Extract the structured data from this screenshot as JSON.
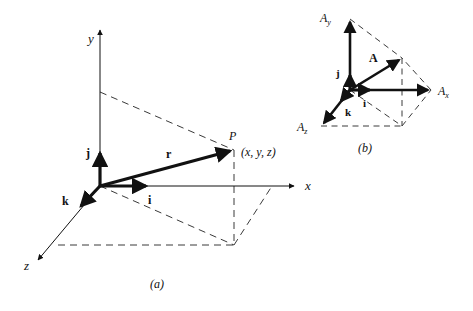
{
  "figure": {
    "title_implicit": "Position vector and unit vectors in Cartesian coordinates",
    "background_color": "#ffffff",
    "stroke_color": "#111111",
    "dash_color": "#3a3a3a",
    "width": 473,
    "height": 311
  },
  "panel_a": {
    "caption": "(a)",
    "caption_pos": {
      "x": 155,
      "y": 285
    },
    "origin": {
      "x": 100,
      "y": 186
    },
    "axes": [
      {
        "name": "y-axis",
        "label": "y",
        "label_pos": {
          "x": 88,
          "y": 43
        },
        "from": {
          "x": 100,
          "y": 186
        },
        "to": {
          "x": 100,
          "y": 28
        }
      },
      {
        "name": "x-axis",
        "label": "x",
        "label_pos": {
          "x": 305,
          "y": 190
        },
        "from": {
          "x": 100,
          "y": 186
        },
        "to": {
          "x": 296,
          "y": 186
        }
      },
      {
        "name": "z-axis",
        "label": "z",
        "label_pos": {
          "x": 24,
          "y": 270
        },
        "from": {
          "x": 100,
          "y": 186
        },
        "to": {
          "x": 36,
          "y": 262
        }
      }
    ],
    "vectors": [
      {
        "name": "unit-vector-i",
        "label": "i",
        "label_pos": {
          "x": 148,
          "y": 203
        },
        "from": {
          "x": 100,
          "y": 186
        },
        "to": {
          "x": 150,
          "y": 186
        }
      },
      {
        "name": "unit-vector-j",
        "label": "j",
        "label_pos": {
          "x": 86,
          "y": 156
        },
        "from": {
          "x": 100,
          "y": 186
        },
        "to": {
          "x": 100,
          "y": 149
        }
      },
      {
        "name": "unit-vector-k",
        "label": "k",
        "label_pos": {
          "x": 63,
          "y": 204
        },
        "from": {
          "x": 100,
          "y": 186
        },
        "to": {
          "x": 79,
          "y": 209
        }
      },
      {
        "name": "position-vector-r",
        "label": "r",
        "label_pos": {
          "x": 167,
          "y": 157
        },
        "from": {
          "x": 100,
          "y": 186
        },
        "to": {
          "x": 234,
          "y": 150
        }
      }
    ],
    "point": {
      "name": "point-P",
      "label": "P",
      "label_pos": {
        "x": 230,
        "y": 139
      },
      "coords_label": "(x, y, z)",
      "coords_pos": {
        "x": 243,
        "y": 155
      },
      "pos": {
        "x": 234,
        "y": 150
      }
    },
    "dashed_lines": [
      {
        "name": "dash-y-to-P",
        "from": {
          "x": 100,
          "y": 92
        },
        "to": {
          "x": 234,
          "y": 150
        }
      },
      {
        "name": "dash-P-down",
        "from": {
          "x": 234,
          "y": 150
        },
        "to": {
          "x": 234,
          "y": 245
        }
      },
      {
        "name": "dash-base-horizontal",
        "from": {
          "x": 58,
          "y": 245
        },
        "to": {
          "x": 234,
          "y": 245
        }
      },
      {
        "name": "dash-origin-to-base-corner",
        "from": {
          "x": 100,
          "y": 186
        },
        "to": {
          "x": 234,
          "y": 245
        }
      },
      {
        "name": "dash-base-corner-to-x",
        "from": {
          "x": 234,
          "y": 245
        },
        "to": {
          "x": 272,
          "y": 186
        }
      }
    ]
  },
  "panel_b": {
    "caption": "(b)",
    "caption_pos": {
      "x": 363,
      "y": 149
    },
    "origin": {
      "x": 350,
      "y": 90
    },
    "components": [
      {
        "name": "component-Ay",
        "label": "A",
        "subscript": "y",
        "label_pos": {
          "x": 322,
          "y": 22
        },
        "from": {
          "x": 350,
          "y": 90
        },
        "to": {
          "x": 350,
          "y": 19
        }
      },
      {
        "name": "component-Ax",
        "label": "A",
        "subscript": "x",
        "label_pos": {
          "x": 438,
          "y": 95
        },
        "from": {
          "x": 350,
          "y": 90
        },
        "to": {
          "x": 431,
          "y": 90
        }
      },
      {
        "name": "component-Az",
        "label": "A",
        "subscript": "z",
        "label_pos": {
          "x": 299,
          "y": 131
        },
        "from": {
          "x": 350,
          "y": 90
        },
        "to": {
          "x": 321,
          "y": 126
        }
      }
    ],
    "vectors": [
      {
        "name": "vector-A",
        "label": "A",
        "label_pos": {
          "x": 370,
          "y": 61
        },
        "from": {
          "x": 350,
          "y": 90
        },
        "to": {
          "x": 402,
          "y": 58
        }
      },
      {
        "name": "unit-vector-i",
        "label": "i",
        "label_pos": {
          "x": 364,
          "y": 106
        },
        "from": {
          "x": 350,
          "y": 90
        },
        "to": {
          "x": 373,
          "y": 90
        }
      },
      {
        "name": "unit-vector-j",
        "label": "j",
        "label_pos": {
          "x": 337,
          "y": 75
        },
        "from": {
          "x": 350,
          "y": 90
        },
        "to": {
          "x": 350,
          "y": 72
        }
      },
      {
        "name": "unit-vector-k",
        "label": "k",
        "label_pos": {
          "x": 347,
          "y": 115
        },
        "from": {
          "x": 350,
          "y": 90
        },
        "to": {
          "x": 339,
          "y": 103
        }
      }
    ],
    "dashed_lines": [
      {
        "name": "dash-Ay-to-A",
        "from": {
          "x": 350,
          "y": 19
        },
        "to": {
          "x": 402,
          "y": 58
        }
      },
      {
        "name": "dash-A-down",
        "from": {
          "x": 402,
          "y": 58
        },
        "to": {
          "x": 402,
          "y": 126
        }
      },
      {
        "name": "dash-Az-to-base",
        "from": {
          "x": 321,
          "y": 126
        },
        "to": {
          "x": 402,
          "y": 126
        }
      },
      {
        "name": "dash-origin-to-base",
        "from": {
          "x": 350,
          "y": 90
        },
        "to": {
          "x": 402,
          "y": 126
        }
      },
      {
        "name": "dash-base-to-Ax",
        "from": {
          "x": 402,
          "y": 126
        },
        "to": {
          "x": 431,
          "y": 90
        }
      },
      {
        "name": "dash-Ax-to-A",
        "from": {
          "x": 431,
          "y": 90
        },
        "to": {
          "x": 402,
          "y": 58
        }
      }
    ]
  }
}
